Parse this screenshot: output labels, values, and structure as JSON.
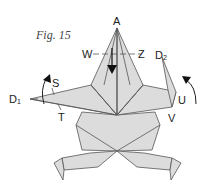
{
  "figure": {
    "caption": "Fig. 15",
    "labels": {
      "A": "A",
      "W": "W",
      "Z": "Z",
      "D1_main": "D",
      "D1_sub": "1",
      "D2_main": "D",
      "D2_sub": "2",
      "S": "S",
      "T": "T",
      "U": "U",
      "V": "V"
    },
    "arrows": [
      {
        "name": "fold-down-arrow",
        "description": "valley fold arrow pointing down from A"
      },
      {
        "name": "left-rotate-arrow",
        "description": "curved arrow near S pointing up"
      },
      {
        "name": "right-rotate-arrow",
        "description": "curved arrow near U pointing up-left"
      }
    ],
    "colors": {
      "paper": "#dcdcdc",
      "line": "#555555",
      "text": "#222222"
    }
  }
}
